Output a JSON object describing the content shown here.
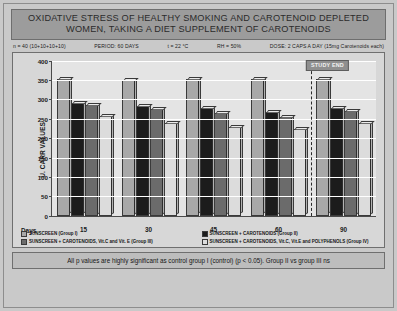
{
  "title": {
    "line1": "OXIDATIVE STRESS OF HEALTHY SMOKING AND CAROTENOID DEPLETED",
    "line2": "WOMEN, TAKING A DIET SUPPLEMENT OF CAROTENOIDS"
  },
  "params": {
    "n": "n = 40 (10+10+10+10)",
    "period": "PERIOD: 60 DAYS",
    "temperature": "t = 22 °C",
    "humidity": "RH = 50%",
    "dose": "DOSE: 2 CAPS A DAY (15mg  Carotenoids each)"
  },
  "annotation": {
    "study_end": "STUDY END"
  },
  "days_axis_label": "Days",
  "footer": {
    "note": "All p values are highly significant as control group I (control) (p < 0.05). Group II vs group III ns"
  },
  "colors": {
    "series1": "#a8a8a8",
    "series2": "#1c1c1c",
    "series3": "#6b6b6b",
    "series4": "#dcdcdc",
    "title_bar": "#9c9c9c",
    "plot_bg": "#e4e4e4",
    "frame_bg": "#d7d7d7",
    "poster_bg": "#c9c9c9",
    "footer_bg": "#bdbdbd",
    "study_end_tag": "#8f8f8f"
  },
  "chart_data": {
    "type": "bar",
    "title": "OXIDATIVE STRESS OF HEALTHY SMOKING AND CAROTENOID DEPLETED WOMEN, TAKING A DIET SUPPLEMENT OF CAROTENOIDS",
    "xlabel": "Days",
    "ylabel": "U. CARR VALUES",
    "ylim": [
      0,
      400
    ],
    "yticks": [
      0,
      50,
      100,
      150,
      200,
      250,
      300,
      350,
      400
    ],
    "grid": true,
    "legend_position": "bottom",
    "categories": [
      "15",
      "30",
      "45",
      "60",
      "90"
    ],
    "series": [
      {
        "name": "SUNSCREEN (Group I)",
        "color": "#a8a8a8",
        "values": [
          352,
          350,
          352,
          352,
          352
        ]
      },
      {
        "name": "SUNSCREEN + CAROTENOIDS (Group II)",
        "color": "#1c1c1c",
        "values": [
          290,
          283,
          278,
          268,
          277
        ]
      },
      {
        "name": "SUNSCREEN + CAROTENOIDS, Vit.C and Vit. E (Group III)",
        "color": "#6b6b6b",
        "values": [
          287,
          275,
          265,
          255,
          270
        ]
      },
      {
        "name": "SUNSCREEN + CAROTENOIDS, Vit.C, Vit.E and POLYPHENOLS (Group IV)",
        "color": "#dcdcdc",
        "values": [
          258,
          240,
          228,
          225,
          240
        ]
      }
    ],
    "annotations": [
      {
        "text": "STUDY END",
        "after_category": "60"
      }
    ]
  }
}
